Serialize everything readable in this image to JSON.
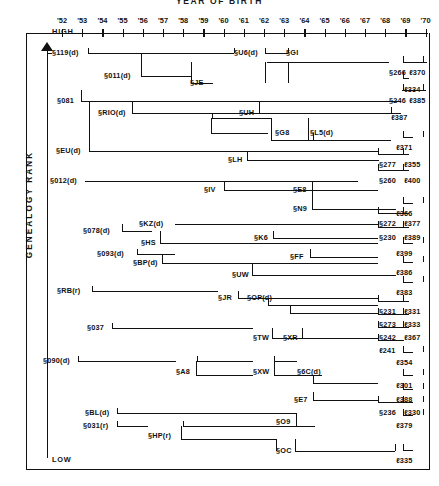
{
  "chart_data": {
    "type": "diagram",
    "title": "YEAR  OF  BIRTH",
    "xlabel": "YEAR OF BIRTH",
    "ylabel": "GENEALOGY  RANK",
    "y_high_label": "HIGH",
    "y_low_label": "LOW",
    "x_tick_labels": [
      "'52",
      "'53",
      "'54",
      "'55",
      "'56",
      "'57",
      "'58",
      "'59",
      "'60",
      "'61",
      "'62",
      "'63",
      "'64",
      "'65",
      "'66",
      "'67",
      "'68",
      "'69",
      "'70"
    ],
    "xlim": [
      1952,
      1970
    ],
    "grid": false,
    "legend": "none",
    "nodes": [
      {
        "id": "n1",
        "label": "§119(d)",
        "x": 52,
        "y": 48,
        "anchor": "left"
      },
      {
        "id": "n2",
        "label": "§U6(d)",
        "x": 234,
        "y": 48,
        "anchor": "left"
      },
      {
        "id": "n3",
        "label": "§GI",
        "x": 286,
        "y": 48,
        "anchor": "left"
      },
      {
        "id": "n4",
        "label": "§011(d)",
        "x": 104,
        "y": 71,
        "anchor": "left"
      },
      {
        "id": "n5",
        "label": "§JE",
        "x": 190,
        "y": 78,
        "anchor": "left"
      },
      {
        "id": "n6",
        "label": "§266",
        "x": 389,
        "y": 68,
        "anchor": "left"
      },
      {
        "id": "n7",
        "label": "ℓ370",
        "x": 409,
        "y": 68,
        "anchor": "left"
      },
      {
        "id": "n8",
        "label": "ℓ334",
        "x": 404,
        "y": 85,
        "anchor": "left"
      },
      {
        "id": "n9",
        "label": "§081",
        "x": 57,
        "y": 96,
        "anchor": "left"
      },
      {
        "id": "n10",
        "label": "§RIO(d)",
        "x": 98,
        "y": 108,
        "anchor": "left"
      },
      {
        "id": "n11",
        "label": "§UH",
        "x": 239,
        "y": 108,
        "anchor": "left"
      },
      {
        "id": "n12",
        "label": "§246",
        "x": 389,
        "y": 96,
        "anchor": "left"
      },
      {
        "id": "n13",
        "label": "ℓ385",
        "x": 409,
        "y": 96,
        "anchor": "left"
      },
      {
        "id": "n14",
        "label": "ℓ387",
        "x": 391,
        "y": 113,
        "anchor": "left"
      },
      {
        "id": "n15",
        "label": "§G8",
        "x": 275,
        "y": 128,
        "anchor": "left"
      },
      {
        "id": "n16",
        "label": "§L5(d)",
        "x": 310,
        "y": 128,
        "anchor": "left"
      },
      {
        "id": "n17",
        "label": "§EU(d)",
        "x": 56,
        "y": 146,
        "anchor": "left"
      },
      {
        "id": "n18",
        "label": "§LH",
        "x": 228,
        "y": 155,
        "anchor": "left"
      },
      {
        "id": "n19",
        "label": "ℓ371",
        "x": 396,
        "y": 143,
        "anchor": "left"
      },
      {
        "id": "n20",
        "label": "§277",
        "x": 379,
        "y": 160,
        "anchor": "left"
      },
      {
        "id": "n21",
        "label": "ℓ355",
        "x": 404,
        "y": 160,
        "anchor": "left"
      },
      {
        "id": "n22",
        "label": "§012(d)",
        "x": 50,
        "y": 176,
        "anchor": "left"
      },
      {
        "id": "n23",
        "label": "§IV",
        "x": 204,
        "y": 185,
        "anchor": "left"
      },
      {
        "id": "n24",
        "label": "§E8",
        "x": 293,
        "y": 185,
        "anchor": "left"
      },
      {
        "id": "n25",
        "label": "§260",
        "x": 379,
        "y": 176,
        "anchor": "left"
      },
      {
        "id": "n26",
        "label": "ℓ400",
        "x": 404,
        "y": 176,
        "anchor": "left"
      },
      {
        "id": "n27",
        "label": "§N9",
        "x": 293,
        "y": 204,
        "anchor": "left"
      },
      {
        "id": "n28",
        "label": "ℓ366",
        "x": 396,
        "y": 209,
        "anchor": "left"
      },
      {
        "id": "n29",
        "label": "§078(d)",
        "x": 83,
        "y": 226,
        "anchor": "left"
      },
      {
        "id": "n30",
        "label": "§KZ(d)",
        "x": 139,
        "y": 219,
        "anchor": "left"
      },
      {
        "id": "n31",
        "label": "§HS",
        "x": 141,
        "y": 238,
        "anchor": "left"
      },
      {
        "id": "n32",
        "label": "§K6",
        "x": 254,
        "y": 233,
        "anchor": "left"
      },
      {
        "id": "n33",
        "label": "§272",
        "x": 379,
        "y": 219,
        "anchor": "left"
      },
      {
        "id": "n34",
        "label": "ℓ377",
        "x": 404,
        "y": 219,
        "anchor": "left"
      },
      {
        "id": "n35",
        "label": "§230",
        "x": 379,
        "y": 233,
        "anchor": "left"
      },
      {
        "id": "n36",
        "label": "ℓ389",
        "x": 404,
        "y": 233,
        "anchor": "left"
      },
      {
        "id": "n37",
        "label": "§093(d)",
        "x": 97,
        "y": 249,
        "anchor": "left"
      },
      {
        "id": "n38",
        "label": "§BP(d)",
        "x": 133,
        "y": 258,
        "anchor": "left"
      },
      {
        "id": "n39",
        "label": "§FF",
        "x": 290,
        "y": 252,
        "anchor": "left"
      },
      {
        "id": "n40",
        "label": "ℓ399",
        "x": 396,
        "y": 249,
        "anchor": "left"
      },
      {
        "id": "n41",
        "label": "§UW",
        "x": 232,
        "y": 270,
        "anchor": "left"
      },
      {
        "id": "n42",
        "label": "ℓ386",
        "x": 396,
        "y": 268,
        "anchor": "left"
      },
      {
        "id": "n43",
        "label": "§RB(r)",
        "x": 57,
        "y": 286,
        "anchor": "left"
      },
      {
        "id": "n44",
        "label": "§JR",
        "x": 218,
        "y": 293,
        "anchor": "left"
      },
      {
        "id": "n45",
        "label": "§OP(d)",
        "x": 247,
        "y": 293,
        "anchor": "left"
      },
      {
        "id": "n46",
        "label": "ℓ383",
        "x": 396,
        "y": 288,
        "anchor": "left"
      },
      {
        "id": "n47",
        "label": "§231",
        "x": 379,
        "y": 307,
        "anchor": "left"
      },
      {
        "id": "n48",
        "label": "ℓ331",
        "x": 404,
        "y": 307,
        "anchor": "left"
      },
      {
        "id": "n49",
        "label": "§273",
        "x": 379,
        "y": 320,
        "anchor": "left"
      },
      {
        "id": "n50",
        "label": "ℓ333",
        "x": 404,
        "y": 320,
        "anchor": "left"
      },
      {
        "id": "n51",
        "label": "§037",
        "x": 87,
        "y": 323,
        "anchor": "left"
      },
      {
        "id": "n52",
        "label": "§TW",
        "x": 253,
        "y": 333,
        "anchor": "left"
      },
      {
        "id": "n53",
        "label": "§XR",
        "x": 283,
        "y": 333,
        "anchor": "left"
      },
      {
        "id": "n54",
        "label": "§242",
        "x": 379,
        "y": 333,
        "anchor": "left"
      },
      {
        "id": "n55",
        "label": "ℓ367",
        "x": 404,
        "y": 333,
        "anchor": "left"
      },
      {
        "id": "n56",
        "label": "ℓ241",
        "x": 379,
        "y": 346,
        "anchor": "left"
      },
      {
        "id": "n57",
        "label": "§090(d)",
        "x": 43,
        "y": 356,
        "anchor": "left"
      },
      {
        "id": "n58",
        "label": "§A8",
        "x": 176,
        "y": 367,
        "anchor": "left"
      },
      {
        "id": "n59",
        "label": "§XW",
        "x": 253,
        "y": 367,
        "anchor": "left"
      },
      {
        "id": "n60",
        "label": "§6C(d)",
        "x": 297,
        "y": 367,
        "anchor": "left"
      },
      {
        "id": "n61",
        "label": "ℓ354",
        "x": 396,
        "y": 358,
        "anchor": "left"
      },
      {
        "id": "n62",
        "label": "ℓ301",
        "x": 396,
        "y": 381,
        "anchor": "left"
      },
      {
        "id": "n63",
        "label": "§E7",
        "x": 294,
        "y": 395,
        "anchor": "left"
      },
      {
        "id": "n64",
        "label": "ℓ388",
        "x": 396,
        "y": 395,
        "anchor": "left"
      },
      {
        "id": "n65",
        "label": "§BL(d)",
        "x": 85,
        "y": 408,
        "anchor": "left"
      },
      {
        "id": "n66",
        "label": "§O9",
        "x": 276,
        "y": 417,
        "anchor": "left"
      },
      {
        "id": "n67",
        "label": "§236",
        "x": 379,
        "y": 408,
        "anchor": "left"
      },
      {
        "id": "n68",
        "label": "ℓ330",
        "x": 404,
        "y": 408,
        "anchor": "left"
      },
      {
        "id": "n69",
        "label": "§031(r)",
        "x": 83,
        "y": 421,
        "anchor": "left"
      },
      {
        "id": "n70",
        "label": "§HP(r)",
        "x": 148,
        "y": 431,
        "anchor": "left"
      },
      {
        "id": "n71",
        "label": "ℓ379",
        "x": 396,
        "y": 421,
        "anchor": "left"
      },
      {
        "id": "n72",
        "label": "§OC",
        "x": 276,
        "y": 446,
        "anchor": "left"
      },
      {
        "id": "n73",
        "label": "ℓ335",
        "x": 396,
        "y": 456,
        "anchor": "left"
      }
    ]
  },
  "axis": {
    "title": "YEAR  OF  BIRTH",
    "y_title": "GENEALOGY  RANK",
    "high": "HIGH",
    "low": "LOW",
    "ticks": [
      "'52",
      "'53",
      "'54",
      "'55",
      "'56",
      "'57",
      "'58",
      "'59",
      "'60",
      "'61",
      "'62",
      "'63",
      "'64",
      "'65",
      "'66",
      "'67",
      "'68",
      "'69",
      "'70"
    ]
  },
  "colors": {
    "ink": "#111111",
    "paper": "#ffffff"
  }
}
